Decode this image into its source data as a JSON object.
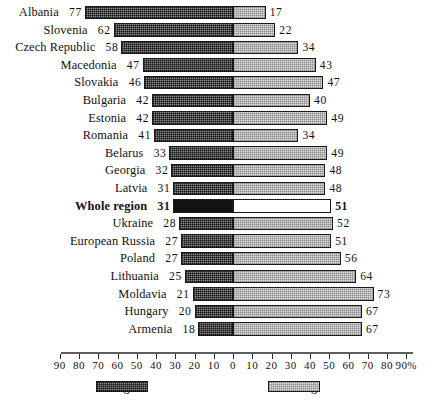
{
  "chart_data": {
    "type": "bar",
    "title": "",
    "subtitle": "",
    "xlabel": "%",
    "ylabel": "",
    "orientation": "horizontal",
    "layout": "diverging-stacked",
    "grid": false,
    "legend_position": "bottom",
    "axis": {
      "unit_suffix": "%",
      "zero_label": "0",
      "left_ticks": [
        90,
        80,
        70,
        60,
        50,
        40,
        30,
        20,
        10
      ],
      "right_ticks": [
        10,
        20,
        30,
        40,
        50,
        60,
        70,
        80,
        90
      ],
      "right_last_label": "90%",
      "left_max": 90,
      "right_max": 90
    },
    "series": [
      {
        "name": "Right",
        "direction": "left",
        "values": [
          77,
          62,
          58,
          47,
          46,
          42,
          42,
          41,
          33,
          32,
          31,
          31,
          28,
          27,
          27,
          25,
          21,
          20,
          18
        ]
      },
      {
        "name": "Wrong",
        "direction": "right",
        "values": [
          17,
          22,
          34,
          43,
          47,
          40,
          49,
          34,
          49,
          48,
          48,
          51,
          52,
          51,
          56,
          64,
          73,
          67,
          67
        ]
      }
    ],
    "categories": [
      "Albania",
      "Slovenia",
      "Czech Republic",
      "Macedonia",
      "Slovakia",
      "Bulgaria",
      "Estonia",
      "Romania",
      "Belarus",
      "Georgia",
      "Latvia",
      "Whole region",
      "Ukraine",
      "European Russia",
      "Poland",
      "Lithuania",
      "Moldavia",
      "Hungary",
      "Armenia"
    ],
    "highlight_category": "Whole region"
  },
  "rows": [
    {
      "label": "Albania",
      "right": 77,
      "wrong": 17,
      "highlight": false
    },
    {
      "label": "Slovenia",
      "right": 62,
      "wrong": 22,
      "highlight": false
    },
    {
      "label": "Czech Republic",
      "right": 58,
      "wrong": 34,
      "highlight": false
    },
    {
      "label": "Macedonia",
      "right": 47,
      "wrong": 43,
      "highlight": false
    },
    {
      "label": "Slovakia",
      "right": 46,
      "wrong": 47,
      "highlight": false
    },
    {
      "label": "Bulgaria",
      "right": 42,
      "wrong": 40,
      "highlight": false
    },
    {
      "label": "Estonia",
      "right": 42,
      "wrong": 49,
      "highlight": false
    },
    {
      "label": "Romania",
      "right": 41,
      "wrong": 34,
      "highlight": false
    },
    {
      "label": "Belarus",
      "right": 33,
      "wrong": 49,
      "highlight": false
    },
    {
      "label": "Georgia",
      "right": 32,
      "wrong": 48,
      "highlight": false
    },
    {
      "label": "Latvia",
      "right": 31,
      "wrong": 48,
      "highlight": false
    },
    {
      "label": "Whole region",
      "right": 31,
      "wrong": 51,
      "highlight": true
    },
    {
      "label": "Ukraine",
      "right": 28,
      "wrong": 52,
      "highlight": false
    },
    {
      "label": "European Russia",
      "right": 27,
      "wrong": 51,
      "highlight": false
    },
    {
      "label": "Poland",
      "right": 27,
      "wrong": 56,
      "highlight": false
    },
    {
      "label": "Lithuania",
      "right": 25,
      "wrong": 64,
      "highlight": false
    },
    {
      "label": "Moldavia",
      "right": 21,
      "wrong": 73,
      "highlight": false
    },
    {
      "label": "Hungary",
      "right": 20,
      "wrong": 67,
      "highlight": false
    },
    {
      "label": "Armenia",
      "right": 18,
      "wrong": 67,
      "highlight": false
    }
  ],
  "legend": {
    "right": {
      "label": "= Right",
      "swatch": "dark-stipple"
    },
    "wrong": {
      "label": "= Wrong",
      "swatch": "light-stipple"
    }
  }
}
